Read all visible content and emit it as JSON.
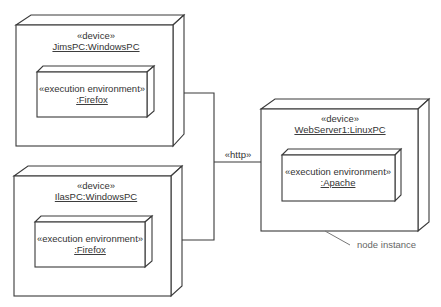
{
  "diagram": {
    "type": "UML deployment diagram",
    "colors": {
      "line": "#3a3a3a",
      "text": "#333333",
      "note_text": "#666666",
      "background": "#ffffff"
    },
    "nodes": [
      {
        "id": "jims-pc",
        "stereotype": "«device»",
        "name": "JimsPC:WindowsPC",
        "execution_environment": {
          "stereotype": "«execution environment»",
          "name": ":Firefox"
        }
      },
      {
        "id": "ilas-pc",
        "stereotype": "«device»",
        "name": "IlasPC:WindowsPC",
        "execution_environment": {
          "stereotype": "«execution environment»",
          "name": ":Firefox"
        }
      },
      {
        "id": "web-server",
        "stereotype": "«device»",
        "name": "WebServer1:LinuxPC",
        "execution_environment": {
          "stereotype": "«execution environment»",
          "name": ":Apache"
        }
      }
    ],
    "connections": [
      {
        "from": "jims-pc",
        "to": "web-server",
        "stereotype": "«http»"
      },
      {
        "from": "ilas-pc",
        "to": "web-server",
        "stereotype": "«http»"
      }
    ],
    "annotations": [
      {
        "target": "web-server",
        "text": "node instance"
      }
    ]
  }
}
